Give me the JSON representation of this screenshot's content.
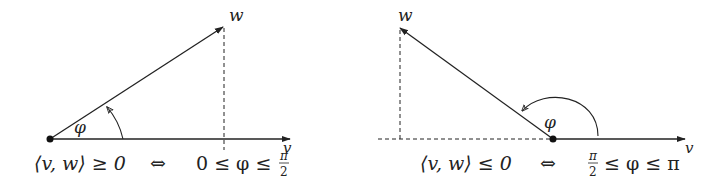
{
  "left_panel": {
    "vector_w_label": "w",
    "vector_v_label": "v",
    "angle_label": "φ",
    "equation_lhs": "⟨v, w⟩ ≥ 0",
    "equivalence": "⇔",
    "equation_rhs_prefix": "0 ≤ φ ≤",
    "fraction_num": "π",
    "fraction_den": "2"
  },
  "right_panel": {
    "vector_w_label": "w",
    "vector_v_label": "v",
    "angle_label": "φ",
    "equation_lhs": "⟨v, w⟩ ≤ 0",
    "equivalence": "⇔",
    "fraction_num": "π",
    "fraction_den": "2",
    "equation_rhs_suffix": "≤ φ ≤ π"
  },
  "colors": {
    "stroke": "#222222",
    "background": "#ffffff"
  }
}
